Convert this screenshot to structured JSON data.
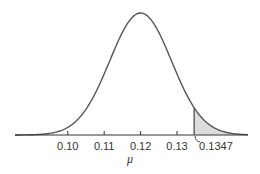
{
  "chart_data": {
    "type": "area",
    "title": "",
    "xlabel": "μ",
    "ylabel": "",
    "distribution": {
      "mean": 0.12,
      "sd": 0.0085
    },
    "x_ticks": [
      0.1,
      0.11,
      0.12,
      0.13
    ],
    "tick_labels": [
      "0.10",
      "0.11",
      "0.12",
      "0.13"
    ],
    "critical_value": 0.1347,
    "critical_label": "0.1347",
    "shaded_region": {
      "from": 0.1347,
      "to": "right tail"
    },
    "xlim": [
      0.0855,
      0.1495
    ],
    "grid": false,
    "legend": null,
    "colors": {
      "curve": "#555555",
      "shade": "#dcdcdc",
      "axis": "#333333"
    }
  }
}
